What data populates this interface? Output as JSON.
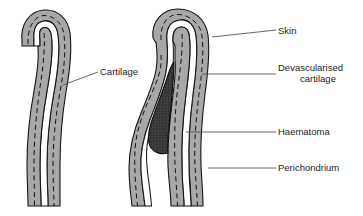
{
  "figure": {
    "title": "",
    "type": "anatomical-cross-section-diagram",
    "panels": [
      {
        "id": "normal-ear-cartilage",
        "position": "left",
        "description": "Normal ear cross-section showing skin, perichondrium and cartilage layers"
      },
      {
        "id": "ear-with-haematoma",
        "position": "right",
        "description": "Ear cross-section with subperichondrial haematoma separating perichondrium from cartilage"
      }
    ]
  },
  "labels": {
    "cartilage": "Cartilage",
    "skin": "Skin",
    "devascularised_line1": "Devascularised",
    "devascularised_line2": "cartilage",
    "haematoma": "Haematoma",
    "perichondrium": "Perichondrium"
  },
  "colors": {
    "tissue_gray": "#a8a8a8",
    "tissue_outline": "#1a1a1a",
    "haematoma_fill": "#3a3a3a",
    "white_channel": "#ffffff",
    "leader_line": "#555555",
    "text": "#1b1b1b",
    "background": "#ffffff"
  }
}
